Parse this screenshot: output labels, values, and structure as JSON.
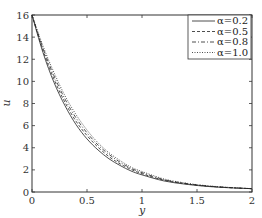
{
  "chart_data": {
    "type": "line",
    "title": "",
    "xlabel": "y",
    "ylabel": "u",
    "xlim": [
      0,
      2
    ],
    "ylim": [
      0,
      16
    ],
    "xticks": [
      0,
      0.5,
      1,
      1.5,
      2
    ],
    "xtick_labels": [
      "0",
      "0.5",
      "1",
      "1.5",
      "2"
    ],
    "yticks": [
      0,
      2,
      4,
      6,
      8,
      10,
      12,
      14,
      16
    ],
    "ytick_labels": [
      "0",
      "2",
      "4",
      "6",
      "8",
      "10",
      "12",
      "14",
      "16"
    ],
    "grid": false,
    "legend_position": "upper right",
    "x": [
      0,
      0.1,
      0.2,
      0.3,
      0.4,
      0.5,
      0.6,
      0.7,
      0.8,
      0.9,
      1.0,
      1.2,
      1.4,
      1.6,
      1.8,
      2.0
    ],
    "series": [
      {
        "name": "α=0.2",
        "style": "solid",
        "values": [
          16,
          12.6,
          9.9,
          7.8,
          6.1,
          4.8,
          3.8,
          3.0,
          2.4,
          1.9,
          1.55,
          1.0,
          0.7,
          0.5,
          0.38,
          0.3
        ]
      },
      {
        "name": "α=0.5",
        "style": "dashed",
        "values": [
          16,
          12.8,
          10.2,
          8.1,
          6.4,
          5.1,
          4.05,
          3.2,
          2.55,
          2.05,
          1.65,
          1.07,
          0.74,
          0.52,
          0.39,
          0.3
        ]
      },
      {
        "name": "α=0.8",
        "style": "dashdot",
        "values": [
          16,
          13.0,
          10.5,
          8.4,
          6.7,
          5.35,
          4.25,
          3.4,
          2.7,
          2.15,
          1.75,
          1.12,
          0.77,
          0.54,
          0.4,
          0.3
        ]
      },
      {
        "name": "α=1.0",
        "style": "dotted",
        "values": [
          16,
          13.2,
          10.8,
          8.7,
          7.0,
          5.6,
          4.45,
          3.55,
          2.85,
          2.25,
          1.85,
          1.18,
          0.8,
          0.56,
          0.41,
          0.3
        ]
      }
    ]
  },
  "legend": {
    "items": [
      {
        "label": "α=0.2",
        "style": "solid"
      },
      {
        "label": "α=0.5",
        "style": "dashed"
      },
      {
        "label": "α=0.8",
        "style": "dashdot"
      },
      {
        "label": "α=1.0",
        "style": "dotted"
      }
    ]
  },
  "colors": {
    "line": "#222222",
    "axis": "#333333",
    "background": "#ffffff"
  }
}
